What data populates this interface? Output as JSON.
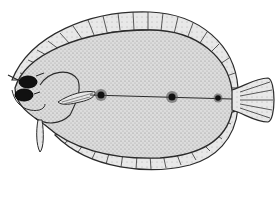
{
  "illustration": {
    "subject": "flatfish (flounder) line drawing",
    "colors": {
      "background": "#ffffff",
      "outline": "#2b2b2b",
      "body_fill": "#d9d9d9",
      "fin_fill": "#e6e6e6",
      "spot": "#1a1a1a"
    },
    "parts": [
      "dorsal-fin",
      "anal-fin",
      "body",
      "head",
      "eyes",
      "pectoral-fin",
      "pelvic-fin",
      "lateral-line",
      "ocellated-spots",
      "caudal-fin"
    ]
  }
}
